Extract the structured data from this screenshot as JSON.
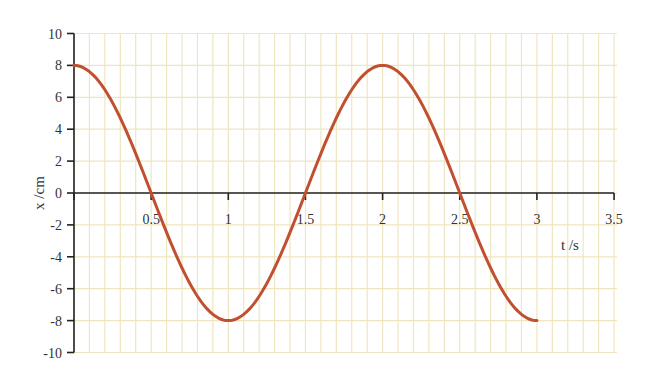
{
  "chart_data": {
    "type": "line",
    "title": "",
    "xlabel": "t /s",
    "ylabel": "x /cm",
    "xlim": [
      0,
      3.5
    ],
    "ylim": [
      -10,
      10
    ],
    "x_ticks": [
      0.5,
      1,
      1.5,
      2,
      2.5,
      3,
      3.5
    ],
    "x_tick_labels": [
      "0.5",
      "1",
      "1.5",
      "2",
      "2.5",
      "3",
      "3.5"
    ],
    "y_ticks": [
      10,
      8,
      6,
      4,
      2,
      0,
      -2,
      -4,
      -6,
      -8,
      -10
    ],
    "y_tick_labels": [
      "10",
      "8",
      "6",
      "4",
      "2",
      "0",
      "-2",
      "-4",
      "-6",
      "-8",
      "-10"
    ],
    "grid": true,
    "grid_minor_x_step": 0.1,
    "grid_y_step": 2,
    "legend": null,
    "series": [
      {
        "name": "x(t) = 8 cos(πt)",
        "color": "#c0502f",
        "function": "8*cos(pi*t)",
        "t_range": [
          0,
          3
        ],
        "x": [
          0,
          0.25,
          0.5,
          0.75,
          1,
          1.25,
          1.5,
          1.75,
          2,
          2.25,
          2.5,
          2.75,
          3
        ],
        "y": [
          8,
          5.66,
          0,
          -5.66,
          -8,
          -5.66,
          0,
          5.66,
          8,
          5.66,
          0,
          -5.66,
          -8
        ]
      }
    ]
  },
  "colors": {
    "grid": "#efe6bf",
    "axis": "#222222",
    "curve": "#c0502f",
    "text": "#333333"
  }
}
